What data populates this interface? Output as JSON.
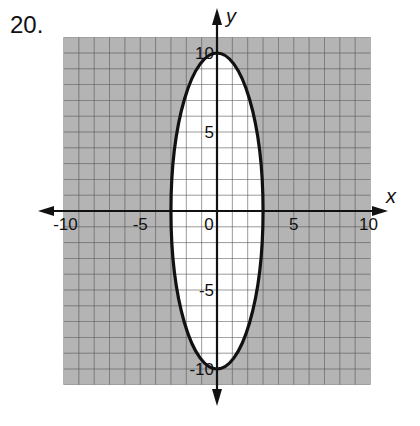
{
  "problem": {
    "number": "20."
  },
  "chart_data": {
    "type": "graph-of-inequality",
    "title": "",
    "xlabel": "x",
    "ylabel": "y",
    "xlim": [
      -10,
      10
    ],
    "ylim": [
      -11,
      11
    ],
    "grid": true,
    "grid_step": 1,
    "x_ticks": [
      {
        "value": -10,
        "label": "-10"
      },
      {
        "value": -5,
        "label": "-5"
      },
      {
        "value": 0,
        "label": "0"
      },
      {
        "value": 5,
        "label": "5"
      },
      {
        "value": 10,
        "label": "10"
      }
    ],
    "y_ticks": [
      {
        "value": 10,
        "label": "10"
      },
      {
        "value": 5,
        "label": "5"
      },
      {
        "value": -5,
        "label": "-5"
      },
      {
        "value": -10,
        "label": "-10"
      }
    ],
    "curve": {
      "shape": "ellipse",
      "center": [
        0,
        0
      ],
      "semi_axis_x": 3,
      "semi_axis_y": 10,
      "equation": "x^2/9 + y^2/100 = 1",
      "line_style": "solid"
    },
    "shaded_region": "outside",
    "colors": {
      "shade": "#b4b4b4",
      "grid_line": "#555555",
      "curve": "#111111",
      "axis": "#111111",
      "inside": "#ffffff"
    }
  }
}
